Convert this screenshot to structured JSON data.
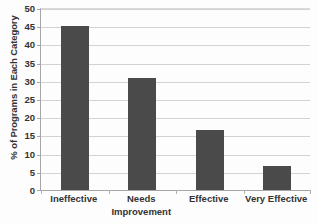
{
  "chart_data": {
    "type": "bar",
    "title": "",
    "subtitle": "",
    "xlabel": "",
    "ylabel": "% of Programs in Each Category",
    "categories": [
      "Ineffective",
      "Needs Improvement",
      "Effective",
      "Very Effective"
    ],
    "values": [
      45,
      30.8,
      16.6,
      6.5
    ],
    "series": [
      {
        "name": "% of Programs in Each Category",
        "values": [
          45,
          30.8,
          16.6,
          6.5
        ]
      }
    ],
    "ylim": [
      0,
      50
    ],
    "ytick_step": 5,
    "ytick_labels": [
      "0",
      "5",
      "10",
      "15",
      "20",
      "25",
      "30",
      "35",
      "40",
      "45",
      "50"
    ],
    "grid": true,
    "grid_axis": "y",
    "legend": false,
    "legend_position": "none",
    "bar_color": "#4a4a4a",
    "gridline_color": "#d3d3d3",
    "axis_color": "#a6a6a6",
    "background_color": "#fdfdfd",
    "annotations": []
  },
  "axis_labels": {
    "category_lines": [
      [
        "Ineffective"
      ],
      [
        "Needs",
        "Improvement"
      ],
      [
        "Effective"
      ],
      [
        "Very Effective"
      ]
    ]
  }
}
